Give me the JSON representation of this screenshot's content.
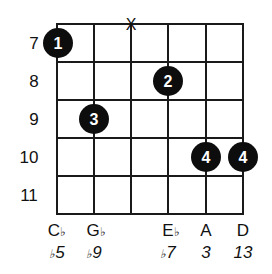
{
  "diagram": {
    "type": "guitar-chord-diagram",
    "frets": [
      "7",
      "8",
      "9",
      "10",
      "11"
    ],
    "strings": 6,
    "muted_string_symbol": "X",
    "muted_string_index": 2,
    "fingers": [
      {
        "string": 0,
        "fret": "7",
        "label": "1"
      },
      {
        "string": 3,
        "fret": "8",
        "label": "2"
      },
      {
        "string": 1,
        "fret": "9",
        "label": "3"
      },
      {
        "string": 4,
        "fret": "10",
        "label": "4"
      },
      {
        "string": 5,
        "fret": "10",
        "label": "4"
      }
    ],
    "notes": [
      {
        "string": 0,
        "note": "C",
        "accidental": "♭",
        "interval_prefix": "♭",
        "interval": "5"
      },
      {
        "string": 1,
        "note": "G",
        "accidental": "♭",
        "interval_prefix": "♭",
        "interval": "9"
      },
      {
        "string": 3,
        "note": "E",
        "accidental": "♭",
        "interval_prefix": "♭",
        "interval": "7"
      },
      {
        "string": 4,
        "note": "A",
        "accidental": "",
        "interval_prefix": "",
        "interval": "3"
      },
      {
        "string": 5,
        "note": "D",
        "accidental": "",
        "interval_prefix": "",
        "interval": "13"
      }
    ],
    "colors": {
      "line": "#1a1a1a",
      "dot": "#0d0d0d",
      "dot_text": "#ffffff"
    }
  }
}
